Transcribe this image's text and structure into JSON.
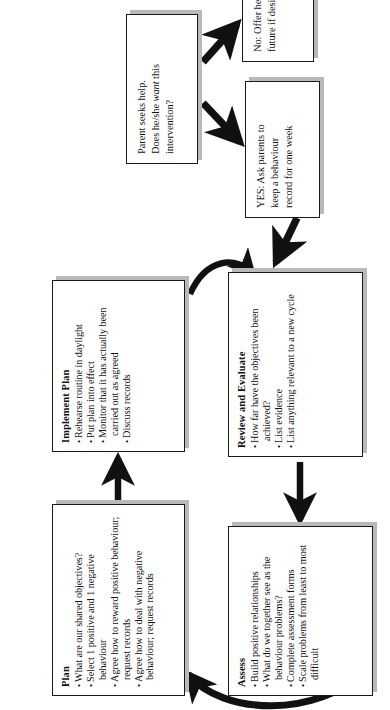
{
  "diagram": {
    "orientation": "rotated-90-ccw",
    "ink_color": "#111111",
    "shadow_color": "#b9b9b9",
    "boxes": [
      {
        "id": "plan",
        "title": "Plan",
        "bullets": [
          "What are our shared objectives?",
          "Select 1 positive and 1 negative behaviour",
          "Agree how to reward positive behaviour; request records",
          "Agree how to deal with negative behaviour; request records"
        ]
      },
      {
        "id": "implement",
        "title": "Implement Plan",
        "bullets": [
          "Rehearse routine in daylight",
          "Put plan into effect",
          "Monitor that it has actually been carried out as agreed",
          "Discuss records"
        ]
      },
      {
        "id": "assess",
        "title": "Assess",
        "bullets": [
          "Build positive relationships",
          "What do we together see as the behaviour problems?",
          "Complete assessment forms",
          "Scale problems from least to most difficult"
        ]
      },
      {
        "id": "review",
        "title": "Review and Evaluate",
        "bullets": [
          "How far have the objectives been achieved?",
          "List evidence",
          "List anything relevant to a new cycle"
        ]
      }
    ],
    "entry_boxes": [
      {
        "id": "parent-seeks-help",
        "line1": "Parent seeks help.",
        "line2_pre": "Does he/she ",
        "line2_em": "want",
        "line2_post": " this",
        "line3": "intervention?"
      },
      {
        "id": "yes-record",
        "line1": "YES: Ask parents  to",
        "line2": "keep a behaviour",
        "line3": "record for one week"
      },
      {
        "id": "no-offer-help",
        "line1": "No: Offer help in",
        "line2": "future if desired"
      }
    ],
    "connectors": [
      {
        "id": "plan-to-implement",
        "type": "straight-arrow",
        "from": "plan",
        "to": "implement"
      },
      {
        "id": "implement-to-review",
        "type": "curved-arrow",
        "from": "implement",
        "to": "review"
      },
      {
        "id": "review-to-assess",
        "type": "straight-arrow",
        "from": "review",
        "to": "assess"
      },
      {
        "id": "assess-to-plan",
        "type": "curved-arrow",
        "from": "assess",
        "to": "plan"
      },
      {
        "id": "yes-to-assess",
        "type": "diagonal-arrow",
        "from": "yes-record",
        "to": "assess"
      },
      {
        "id": "parent-to-yes",
        "type": "diagonal-arrow",
        "from": "parent-seeks-help",
        "to": "yes-record"
      },
      {
        "id": "parent-to-no",
        "type": "diagonal-arrow",
        "from": "parent-seeks-help",
        "to": "no-offer-help"
      }
    ]
  }
}
